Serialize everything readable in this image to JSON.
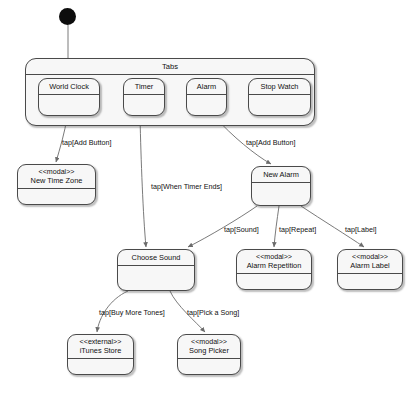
{
  "diagram": {
    "type": "uml-state-machine",
    "title": "Tabs",
    "start_node": {
      "name": "initial-state"
    },
    "composite_state": {
      "label": "Tabs",
      "children": [
        {
          "id": "world-clock",
          "label": "World Clock"
        },
        {
          "id": "timer",
          "label": "Timer"
        },
        {
          "id": "alarm",
          "label": "Alarm"
        },
        {
          "id": "stop-watch",
          "label": "Stop Watch"
        }
      ]
    },
    "states": [
      {
        "id": "new-time-zone",
        "stereotype": "<<modal>>",
        "label": "New Time Zone"
      },
      {
        "id": "new-alarm",
        "stereotype": "",
        "label": "New Alarm"
      },
      {
        "id": "choose-sound",
        "stereotype": "",
        "label": "Choose Sound"
      },
      {
        "id": "alarm-repetition",
        "stereotype": "<<modal>>",
        "label": "Alarm Repetition"
      },
      {
        "id": "alarm-label",
        "stereotype": "<<modal>>",
        "label": "Alarm Label"
      },
      {
        "id": "itunes-store",
        "stereotype": "<<external>>",
        "label": "iTunes Store"
      },
      {
        "id": "song-picker",
        "stereotype": "<<modal>>",
        "label": "Song Picker"
      }
    ],
    "transitions": [
      {
        "id": "t-add-button-world-clock",
        "label": "tap[Add Button]",
        "from": "world-clock",
        "to": "new-time-zone"
      },
      {
        "id": "t-when-timer-ends",
        "label": "tap[When Timer Ends]",
        "from": "timer",
        "to": "choose-sound"
      },
      {
        "id": "t-add-button-alarm",
        "label": "tap[Add Button]",
        "from": "alarm",
        "to": "new-alarm"
      },
      {
        "id": "t-sound",
        "label": "tap[Sound]",
        "from": "new-alarm",
        "to": "choose-sound"
      },
      {
        "id": "t-repeat",
        "label": "tap[Repeat]",
        "from": "new-alarm",
        "to": "alarm-repetition"
      },
      {
        "id": "t-label",
        "label": "tap[Label]",
        "from": "new-alarm",
        "to": "alarm-label"
      },
      {
        "id": "t-buy-more-tones",
        "label": "tap[Buy More Tones]",
        "from": "choose-sound",
        "to": "itunes-store"
      },
      {
        "id": "t-pick-a-song",
        "label": "tap[Pick a Song]",
        "from": "choose-sound",
        "to": "song-picker"
      }
    ],
    "colors": {
      "node_fill": "#f7f7f7",
      "stroke": "#4a4a4a",
      "edge": "#6b6b6b",
      "start_fill": "#0d0d0d",
      "background": "#ffffff"
    }
  }
}
